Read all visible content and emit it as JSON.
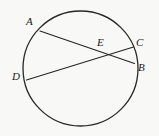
{
  "figure": {
    "background_color": "#f8f8f6",
    "stroke_color": "#262626",
    "label_color": "#1b1b1b"
  },
  "circle": {
    "name": "circle-outline",
    "cx": 80.5,
    "cy": 68.5,
    "r": 57.5,
    "stroke_width": 1.3,
    "fill": "none"
  },
  "chords": [
    {
      "name": "chord-AB",
      "from": "A",
      "to": "B",
      "x1": 40,
      "y1": 31,
      "x2": 134.5,
      "y2": 63.5,
      "stroke_width": 1.2
    },
    {
      "name": "chord-DC",
      "from": "D",
      "to": "C",
      "x1": 26.5,
      "y1": 80,
      "x2": 133.5,
      "y2": 47,
      "stroke_width": 1.2
    }
  ],
  "points": {
    "A": {
      "label": "A",
      "x": 40,
      "y": 31,
      "label_x": 26,
      "label_y": 16
    },
    "B": {
      "label": "B",
      "x": 134.5,
      "y": 63.5,
      "label_x": 138,
      "label_y": 62
    },
    "C": {
      "label": "C",
      "x": 133.5,
      "y": 47,
      "label_x": 136,
      "label_y": 37
    },
    "D": {
      "label": "D",
      "x": 26.5,
      "y": 80,
      "label_x": 12,
      "label_y": 71
    },
    "E": {
      "label": "E",
      "x": 100,
      "y": 55,
      "label_x": 97,
      "label_y": 37
    }
  }
}
